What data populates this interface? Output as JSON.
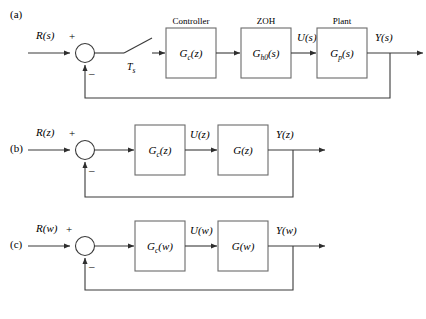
{
  "figure": {
    "title_note": "Block diagrams of a digital control system in s, z and w domains",
    "line_color": "#3a3a3a",
    "box_border_color": "#6b6b6b",
    "text_color": "#1a1a1a",
    "background": "#ffffff"
  },
  "panels": [
    {
      "id": "a",
      "label": "(a)",
      "input_signal": "R(s)",
      "plus_sign": "+",
      "minus_sign": "–",
      "sampler_label": "T",
      "sampler_sub": "s",
      "blocks": [
        {
          "caption": "Controller",
          "base": "G",
          "sub": "c",
          "arg": "(z)"
        },
        {
          "caption": "ZOH",
          "base": "G",
          "sub": "h0",
          "arg": "(s)"
        },
        {
          "caption": "Plant",
          "base": "G",
          "sub": "p",
          "arg": "(s)"
        }
      ],
      "mid_signal": "U(s)",
      "output_signal": "Y(s)"
    },
    {
      "id": "b",
      "label": "(b)",
      "input_signal": "R(z)",
      "plus_sign": "+",
      "minus_sign": "–",
      "blocks": [
        {
          "caption": "",
          "base": "G",
          "sub": "c",
          "arg": "(z)"
        },
        {
          "caption": "",
          "base": "G",
          "sub": "",
          "arg": "(z)"
        }
      ],
      "mid_signal": "U(z)",
      "output_signal": "Y(z)"
    },
    {
      "id": "c",
      "label": "(c)",
      "input_signal": "R(w)",
      "plus_sign": "+",
      "minus_sign": "–",
      "blocks": [
        {
          "caption": "",
          "base": "G",
          "sub": "c",
          "arg": "(w)"
        },
        {
          "caption": "",
          "base": "G",
          "sub": "",
          "arg": "(w)"
        }
      ],
      "mid_signal": "U(w)",
      "output_signal": "Y(w)"
    }
  ]
}
